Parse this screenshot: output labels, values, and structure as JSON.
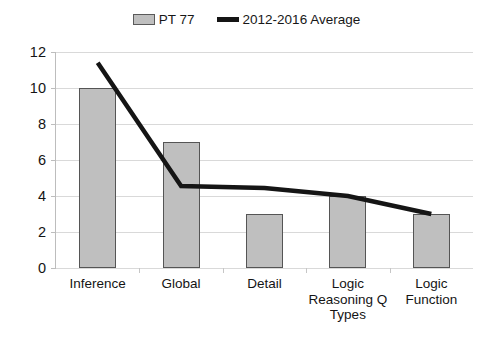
{
  "legend": {
    "items": [
      {
        "label": "PT 77",
        "marker": "bar-swatch-icon",
        "color": "#BFBFBF"
      },
      {
        "label": "2012-2016 Average",
        "marker": "line-swatch-icon",
        "color": "#151515"
      }
    ]
  },
  "axis": {
    "y_ticks": [
      "12",
      "10",
      "8",
      "6",
      "4",
      "2",
      "0"
    ]
  },
  "chart_data": {
    "type": "bar",
    "title": "",
    "subtitle": "",
    "xlabel": "",
    "ylabel": "",
    "ylim": [
      0,
      12
    ],
    "ytick_step": 2,
    "grid": true,
    "legend_position": "top-center",
    "categories": [
      "Inference",
      "Global",
      "Detail",
      "Logic Reasoning Q Types",
      "Logic Function"
    ],
    "series": [
      {
        "name": "PT 77",
        "type": "bar",
        "color": "#BFBFBF",
        "border_color": "#555555",
        "values": [
          10,
          7,
          3,
          4,
          3
        ]
      },
      {
        "name": "2012-2016 Average",
        "type": "line",
        "color": "#151515",
        "values": [
          11.4,
          4.55,
          4.45,
          4.0,
          3.0
        ]
      }
    ],
    "annotations": []
  }
}
